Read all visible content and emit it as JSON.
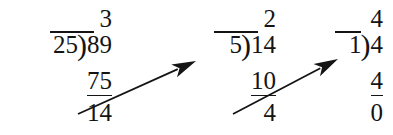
{
  "figure": {
    "type": "long-division-chain",
    "background_color": "#ffffff",
    "ink_color": "#141414"
  },
  "divisions": [
    {
      "index": 1,
      "quotient": "3",
      "divisor": "25",
      "bracket": ")",
      "dividend": "89",
      "subtrahend": "75",
      "remainder": "14",
      "left": 4,
      "dividend_width": 44,
      "vinculum_left": 46,
      "vinculum_width": 44
    },
    {
      "index": 2,
      "quotient": "2",
      "divisor": "5",
      "bracket": ")",
      "dividend": "14",
      "subtrahend": "10",
      "remainder": "4",
      "left": 168,
      "dividend_width": 44,
      "vinculum_left": 46,
      "vinculum_width": 44
    },
    {
      "index": 3,
      "quotient": "4",
      "divisor": "1",
      "bracket": ")",
      "dividend": "4",
      "subtrahend": "4",
      "remainder": "0",
      "left": 275,
      "dividend_width": 28,
      "vinculum_left": 60,
      "vinculum_width": 26
    }
  ],
  "arrows": [
    {
      "name": "arrow-remainder-1-to-divisor-2",
      "from_label": "14",
      "to_label": "5",
      "x1": 78,
      "y1": 114,
      "x2": 196,
      "y2": 61
    },
    {
      "name": "arrow-remainder-2-to-divisor-3",
      "from_label": "4",
      "to_label": "1",
      "x1": 233,
      "y1": 114,
      "x2": 338,
      "y2": 59
    }
  ]
}
